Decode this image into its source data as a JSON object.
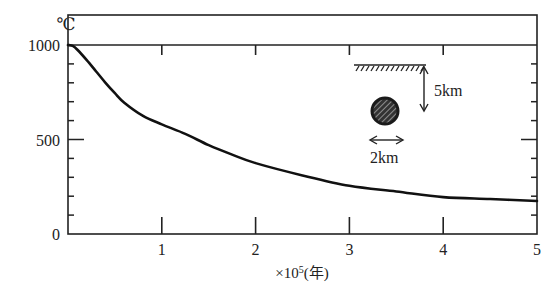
{
  "chart_data": {
    "type": "line",
    "title": "",
    "xlabel": "×10⁵(年)",
    "xlabel_parts": {
      "prefix": "×10",
      "exp": "5",
      "suffix": "(年)"
    },
    "ylabel": "℃",
    "xlim": [
      0,
      5
    ],
    "ylim": [
      0,
      1000
    ],
    "x_ticks": [
      1,
      2,
      3,
      4,
      5
    ],
    "x_tick_labels": [
      "1",
      "2",
      "3",
      "4",
      "5"
    ],
    "y_ticks": [
      0,
      500,
      1000
    ],
    "y_tick_labels": [
      "0",
      "500",
      "1000"
    ],
    "y_minor_step": 100,
    "grid": false,
    "series": [
      {
        "name": "temperature",
        "x": [
          0,
          0.05,
          0.1,
          0.2,
          0.3,
          0.4,
          0.5,
          0.6,
          0.8,
          1.0,
          1.25,
          1.5,
          1.75,
          2.0,
          2.5,
          3.0,
          3.5,
          4.0,
          4.5,
          5.0
        ],
        "y": [
          1000,
          995,
          975,
          920,
          860,
          800,
          745,
          695,
          625,
          580,
          530,
          470,
          420,
          375,
          310,
          255,
          225,
          195,
          185,
          175
        ]
      }
    ],
    "inset": {
      "depth_label": "5km",
      "diameter_label": "2km",
      "description": "hatched ground surface line, intrusive body (hatched circle) at 5km depth, diameter 2km"
    }
  },
  "colors": {
    "ink": "#1a1a1a",
    "background": "#ffffff"
  }
}
